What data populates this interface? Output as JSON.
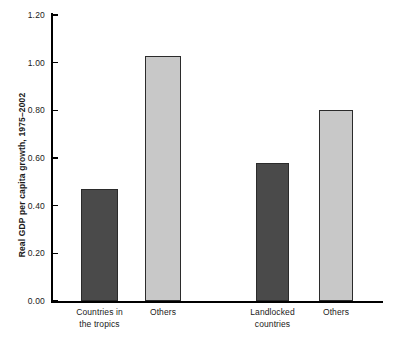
{
  "chart_data": {
    "type": "bar",
    "title": "",
    "xlabel": "",
    "ylabel": "Real GDP per capita growth, 1975–2002",
    "ylim": [
      0.0,
      1.2
    ],
    "grid": false,
    "legend": "none",
    "ytick_labels": [
      "1.20",
      "1.00",
      "0.80",
      "0.60",
      "0.40",
      "0.20",
      "0.00"
    ],
    "ytick_values": [
      1.2,
      1.0,
      0.8,
      0.6,
      0.4,
      0.2,
      0.0
    ],
    "groups": [
      {
        "name": "Tropics comparison",
        "bars": [
          {
            "category": "Countries in the tropics",
            "category_line1": "Countries in",
            "category_line2": "the tropics",
            "value": 0.47,
            "color": "#4a4a4a"
          },
          {
            "category": "Others",
            "category_line1": "Others",
            "category_line2": "",
            "value": 1.03,
            "color": "#c8c8c8"
          }
        ]
      },
      {
        "name": "Landlocked comparison",
        "bars": [
          {
            "category": "Landlocked countries",
            "category_line1": "Landlocked",
            "category_line2": "countries",
            "value": 0.58,
            "color": "#4a4a4a"
          },
          {
            "category": "Others",
            "category_line1": "Others",
            "category_line2": "",
            "value": 0.8,
            "color": "#c8c8c8"
          }
        ]
      }
    ],
    "categories": [
      "Countries in the tropics",
      "Others",
      "Landlocked countries",
      "Others"
    ],
    "values": [
      0.47,
      1.03,
      0.58,
      0.8
    ],
    "colors": {
      "dark_bar": "#4a4a4a",
      "light_bar": "#c8c8c8",
      "bar_outline": "#2b2b2b",
      "axis": "#000000",
      "text": "#1a1a1a",
      "background": "#ffffff"
    }
  }
}
